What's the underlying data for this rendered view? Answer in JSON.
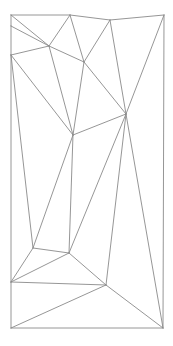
{
  "diagram": {
    "type": "triangulation",
    "stroke_color": "#8a8a8a",
    "stroke_width": 0.9,
    "background": "#ffffff",
    "vertices": [
      {
        "id": "A",
        "x": 11,
        "y": 15
      },
      {
        "id": "B",
        "x": 70,
        "y": 15
      },
      {
        "id": "C",
        "x": 110,
        "y": 20
      },
      {
        "id": "D",
        "x": 164,
        "y": 15
      },
      {
        "id": "E",
        "x": 11,
        "y": 26
      },
      {
        "id": "F",
        "x": 49,
        "y": 46
      },
      {
        "id": "G",
        "x": 11,
        "y": 55
      },
      {
        "id": "H",
        "x": 84,
        "y": 62
      },
      {
        "id": "I",
        "x": 126,
        "y": 114
      },
      {
        "id": "J",
        "x": 73,
        "y": 135
      },
      {
        "id": "K",
        "x": 33,
        "y": 248
      },
      {
        "id": "L",
        "x": 69,
        "y": 253
      },
      {
        "id": "M",
        "x": 11,
        "y": 282
      },
      {
        "id": "N",
        "x": 106,
        "y": 285
      },
      {
        "id": "O",
        "x": 11,
        "y": 328
      },
      {
        "id": "P",
        "x": 163,
        "y": 328
      }
    ],
    "edges": [
      [
        "A",
        "B"
      ],
      [
        "B",
        "C"
      ],
      [
        "C",
        "D"
      ],
      [
        "A",
        "E"
      ],
      [
        "E",
        "G"
      ],
      [
        "G",
        "M"
      ],
      [
        "M",
        "O"
      ],
      [
        "D",
        "P"
      ],
      [
        "O",
        "P"
      ],
      [
        "A",
        "F"
      ],
      [
        "E",
        "F"
      ],
      [
        "B",
        "F"
      ],
      [
        "G",
        "F"
      ],
      [
        "F",
        "H"
      ],
      [
        "F",
        "J"
      ],
      [
        "B",
        "H"
      ],
      [
        "C",
        "H"
      ],
      [
        "H",
        "I"
      ],
      [
        "H",
        "J"
      ],
      [
        "C",
        "I"
      ],
      [
        "D",
        "I"
      ],
      [
        "G",
        "J"
      ],
      [
        "J",
        "I"
      ],
      [
        "G",
        "K"
      ],
      [
        "J",
        "K"
      ],
      [
        "J",
        "L"
      ],
      [
        "I",
        "L"
      ],
      [
        "I",
        "N"
      ],
      [
        "I",
        "P"
      ],
      [
        "K",
        "L"
      ],
      [
        "K",
        "M"
      ],
      [
        "L",
        "M"
      ],
      [
        "L",
        "N"
      ],
      [
        "M",
        "N"
      ],
      [
        "O",
        "N"
      ],
      [
        "N",
        "P"
      ]
    ]
  }
}
